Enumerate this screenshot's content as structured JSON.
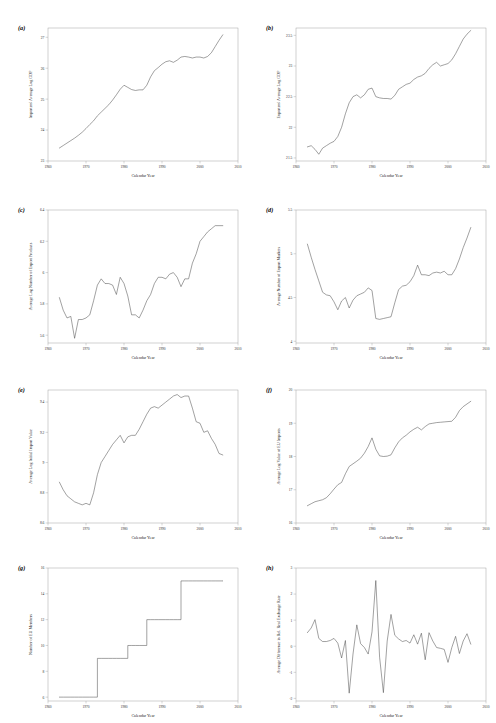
{
  "figure": {
    "panel_count": 8,
    "shared_xlabel": "Calendar Year",
    "shared_xticks": [
      "1960",
      "1970",
      "1980",
      "1990",
      "2000",
      "2010"
    ],
    "xlim": [
      1960,
      2010
    ]
  },
  "chart_data": [
    {
      "type": "line",
      "tag": "(a)",
      "title": "",
      "xlabel": "Calendar Year",
      "ylabel": "Importers' Average Log GDP",
      "xlim": [
        1960,
        2010
      ],
      "ylim": [
        23,
        27.3
      ],
      "xticks": [
        1960,
        1970,
        1980,
        1990,
        2000,
        2010
      ],
      "xticklabels": [
        "1960",
        "1970",
        "1980",
        "1990",
        "2000",
        "2010"
      ],
      "yticks": [
        23,
        24,
        25,
        26,
        27
      ],
      "yticklabels": [
        "23",
        "24",
        "25",
        "26",
        "27"
      ],
      "grid": false,
      "legend": "none",
      "x": [
        1963,
        1964,
        1965,
        1966,
        1967,
        1968,
        1969,
        1970,
        1971,
        1972,
        1973,
        1974,
        1975,
        1976,
        1977,
        1978,
        1979,
        1980,
        1981,
        1982,
        1983,
        1984,
        1985,
        1986,
        1987,
        1988,
        1989,
        1990,
        1991,
        1992,
        1993,
        1994,
        1995,
        1996,
        1997,
        1998,
        1999,
        2000,
        2001,
        2002,
        2003,
        2004,
        2005,
        2006
      ],
      "y": [
        23.42,
        23.5,
        23.58,
        23.66,
        23.74,
        23.83,
        23.93,
        24.05,
        24.18,
        24.3,
        24.46,
        24.58,
        24.7,
        24.82,
        24.97,
        25.14,
        25.32,
        25.45,
        25.38,
        25.31,
        25.28,
        25.3,
        25.3,
        25.45,
        25.72,
        25.92,
        26.02,
        26.13,
        26.21,
        26.24,
        26.19,
        26.26,
        26.36,
        26.38,
        26.36,
        26.33,
        26.36,
        26.36,
        26.33,
        26.38,
        26.5,
        26.7,
        26.9,
        27.08
      ],
      "series_note": "Importers' average log GDP, steadily rising with plateaus around 1981-1985 and 1996-2002"
    },
    {
      "type": "line",
      "tag": "(b)",
      "title": "",
      "xlabel": "Calendar Year",
      "ylabel": "Exporters' Average Log GDP",
      "xlim": [
        1960,
        2010
      ],
      "ylim": [
        21.45,
        23.62
      ],
      "xticks": [
        1960,
        1970,
        1980,
        1990,
        2000,
        2010
      ],
      "xticklabels": [
        "1960",
        "1970",
        "1980",
        "1990",
        "2000",
        "2010"
      ],
      "yticks": [
        21.5,
        22,
        22.5,
        23,
        23.5
      ],
      "yticklabels": [
        "21.5",
        "22",
        "22.5",
        "23",
        "23.5"
      ],
      "grid": false,
      "legend": "none",
      "x": [
        1963,
        1964,
        1965,
        1966,
        1967,
        1968,
        1969,
        1970,
        1971,
        1972,
        1973,
        1974,
        1975,
        1976,
        1977,
        1978,
        1979,
        1980,
        1981,
        1982,
        1983,
        1984,
        1985,
        1986,
        1987,
        1988,
        1989,
        1990,
        1991,
        1992,
        1993,
        1994,
        1995,
        1996,
        1997,
        1998,
        1999,
        2000,
        2001,
        2002,
        2003,
        2004,
        2005,
        2006
      ],
      "y": [
        21.68,
        21.7,
        21.64,
        21.56,
        21.66,
        21.7,
        21.74,
        21.77,
        21.85,
        22.0,
        22.22,
        22.4,
        22.5,
        22.53,
        22.48,
        22.53,
        22.62,
        22.64,
        22.5,
        22.48,
        22.47,
        22.47,
        22.46,
        22.52,
        22.62,
        22.66,
        22.7,
        22.72,
        22.78,
        22.82,
        22.84,
        22.88,
        22.96,
        23.02,
        23.06,
        23.0,
        23.02,
        23.04,
        23.1,
        23.2,
        23.32,
        23.44,
        23.52,
        23.58
      ],
      "series_note": "Exporters' average log GDP, dip near 1967, sharp rise through 1970s, plateau 1981-1986, steady climb to 2006"
    },
    {
      "type": "line",
      "tag": "(c)",
      "title": "",
      "xlabel": "Calendar Year",
      "ylabel": "Average Log Number of Export Products",
      "xlim": [
        1960,
        2010
      ],
      "ylim": [
        5.55,
        6.4
      ],
      "xticks": [
        1960,
        1970,
        1980,
        1990,
        2000,
        2010
      ],
      "xticklabels": [
        "1960",
        "1970",
        "1980",
        "1990",
        "2000",
        "2010"
      ],
      "yticks": [
        5.6,
        5.8,
        6.0,
        6.2,
        6.4
      ],
      "yticklabels": [
        "5.6",
        "5.8",
        "6",
        "6.2",
        "6.4"
      ],
      "grid": false,
      "legend": "none",
      "x": [
        1963,
        1964,
        1965,
        1966,
        1967,
        1968,
        1969,
        1970,
        1971,
        1972,
        1973,
        1974,
        1975,
        1976,
        1977,
        1978,
        1979,
        1980,
        1981,
        1982,
        1983,
        1984,
        1985,
        1986,
        1987,
        1988,
        1989,
        1990,
        1991,
        1992,
        1993,
        1994,
        1995,
        1996,
        1997,
        1998,
        1999,
        2000,
        2001,
        2002,
        2003,
        2004,
        2005,
        2006
      ],
      "y": [
        5.84,
        5.76,
        5.71,
        5.72,
        5.58,
        5.7,
        5.7,
        5.71,
        5.73,
        5.82,
        5.92,
        5.96,
        5.93,
        5.93,
        5.92,
        5.86,
        5.97,
        5.93,
        5.85,
        5.73,
        5.73,
        5.71,
        5.76,
        5.82,
        5.86,
        5.93,
        5.97,
        5.97,
        5.96,
        5.99,
        6.0,
        5.97,
        5.91,
        5.96,
        5.96,
        6.06,
        6.12,
        6.2,
        6.23,
        6.26,
        6.28,
        6.3,
        6.3,
        6.3
      ],
      "series_note": "Average log number of export products, volatile mid-century, strong upward trend after 1997"
    },
    {
      "type": "line",
      "tag": "(d)",
      "title": "",
      "xlabel": "Calendar Year",
      "ylabel": "Average Number of Export Markets",
      "xlim": [
        1960,
        2010
      ],
      "ylim": [
        3.98,
        5.5
      ],
      "xticks": [
        1960,
        1970,
        1980,
        1990,
        2000,
        2010
      ],
      "xticklabels": [
        "1960",
        "1970",
        "1980",
        "1990",
        "2000",
        "2010"
      ],
      "yticks": [
        4,
        4.5,
        5,
        5.5
      ],
      "yticklabels": [
        "4",
        "4.5",
        "5",
        "5.5"
      ],
      "grid": false,
      "legend": "none",
      "x": [
        1963,
        1964,
        1965,
        1966,
        1967,
        1968,
        1969,
        1970,
        1971,
        1972,
        1973,
        1974,
        1975,
        1976,
        1977,
        1978,
        1979,
        1980,
        1981,
        1982,
        1983,
        1984,
        1985,
        1986,
        1987,
        1988,
        1989,
        1990,
        1991,
        1992,
        1993,
        1994,
        1995,
        1996,
        1997,
        1998,
        1999,
        2000,
        2001,
        2002,
        2003,
        2004,
        2005,
        2006
      ],
      "y": [
        5.11,
        4.96,
        4.82,
        4.69,
        4.56,
        4.53,
        4.52,
        4.45,
        4.36,
        4.46,
        4.5,
        4.38,
        4.47,
        4.52,
        4.54,
        4.56,
        4.61,
        4.58,
        4.26,
        4.25,
        4.26,
        4.27,
        4.28,
        4.44,
        4.59,
        4.63,
        4.64,
        4.68,
        4.75,
        4.87,
        4.76,
        4.76,
        4.75,
        4.78,
        4.79,
        4.78,
        4.8,
        4.76,
        4.76,
        4.83,
        4.94,
        5.07,
        5.18,
        5.3
      ],
      "series_note": "Average number of export markets, declines through 1960s-70s, trough 1981-1985, recovery to 5.3 by 2006"
    },
    {
      "type": "line",
      "tag": "(e)",
      "title": "",
      "xlabel": "Calendar Year",
      "ylabel": "Average Log Initial Import Value",
      "xlim": [
        1960,
        2010
      ],
      "ylim": [
        8.6,
        9.48
      ],
      "xticks": [
        1960,
        1970,
        1980,
        1990,
        2000,
        2010
      ],
      "xticklabels": [
        "1960",
        "1970",
        "1980",
        "1990",
        "2000",
        "2010"
      ],
      "yticks": [
        8.6,
        8.8,
        9.0,
        9.2,
        9.4
      ],
      "yticklabels": [
        "8.6",
        "8.8",
        "9",
        "9.2",
        "9.4"
      ],
      "grid": false,
      "legend": "none",
      "x": [
        1963,
        1964,
        1965,
        1966,
        1967,
        1968,
        1969,
        1970,
        1971,
        1972,
        1973,
        1974,
        1975,
        1976,
        1977,
        1978,
        1979,
        1980,
        1981,
        1982,
        1983,
        1984,
        1985,
        1986,
        1987,
        1988,
        1989,
        1990,
        1991,
        1992,
        1993,
        1994,
        1995,
        1996,
        1997,
        1998,
        1999,
        2000,
        2001,
        2002,
        2003,
        2004,
        2005,
        2006
      ],
      "y": [
        8.87,
        8.82,
        8.78,
        8.76,
        8.74,
        8.73,
        8.72,
        8.73,
        8.72,
        8.8,
        8.92,
        9.0,
        9.04,
        9.08,
        9.12,
        9.15,
        9.18,
        9.13,
        9.17,
        9.18,
        9.18,
        9.22,
        9.27,
        9.32,
        9.36,
        9.37,
        9.36,
        9.38,
        9.4,
        9.42,
        9.44,
        9.45,
        9.43,
        9.44,
        9.44,
        9.36,
        9.27,
        9.26,
        9.2,
        9.21,
        9.16,
        9.12,
        9.06,
        9.05
      ],
      "series_note": "Average log initial import value, declining early, rising sharply 1971-1979, peak near 1996, decline after 1998"
    },
    {
      "type": "line",
      "tag": "(f)",
      "title": "",
      "xlabel": "Calendar Year",
      "ylabel": "Average Log Value of EU Imports",
      "xlim": [
        1960,
        2010
      ],
      "ylim": [
        16,
        20
      ],
      "xticks": [
        1960,
        1970,
        1980,
        1990,
        2000,
        2010
      ],
      "xticklabels": [
        "1960",
        "1970",
        "1980",
        "1990",
        "2000",
        "2010"
      ],
      "yticks": [
        16,
        17,
        18,
        19,
        20
      ],
      "yticklabels": [
        "16",
        "17",
        "18",
        "19",
        "20"
      ],
      "grid": false,
      "legend": "none",
      "x": [
        1963,
        1964,
        1965,
        1966,
        1967,
        1968,
        1969,
        1970,
        1971,
        1972,
        1973,
        1974,
        1975,
        1976,
        1977,
        1978,
        1979,
        1980,
        1981,
        1982,
        1983,
        1984,
        1985,
        1986,
        1987,
        1988,
        1989,
        1990,
        1991,
        1992,
        1993,
        1994,
        1995,
        1996,
        1997,
        1998,
        1999,
        2000,
        2001,
        2002,
        2003,
        2004,
        2005,
        2006
      ],
      "y": [
        16.52,
        16.58,
        16.64,
        16.67,
        16.7,
        16.76,
        16.88,
        17.02,
        17.15,
        17.22,
        17.48,
        17.7,
        17.78,
        17.86,
        17.95,
        18.1,
        18.3,
        18.56,
        18.22,
        18.02,
        18.0,
        18.01,
        18.05,
        18.26,
        18.44,
        18.56,
        18.64,
        18.74,
        18.82,
        18.88,
        18.8,
        18.9,
        18.98,
        19.0,
        19.02,
        19.03,
        19.04,
        19.05,
        19.06,
        19.18,
        19.38,
        19.5,
        19.58,
        19.66
      ],
      "series_note": "Average log value of EU imports, monotone rising with dip around 1981-1983"
    },
    {
      "type": "line",
      "tag": "(g)",
      "title": "",
      "xlabel": "Calendar Year",
      "ylabel": "Number of EU Members",
      "xlim": [
        1960,
        2010
      ],
      "ylim": [
        5.7,
        16
      ],
      "xticks": [
        1960,
        1970,
        1980,
        1990,
        2000,
        2010
      ],
      "xticklabels": [
        "1960",
        "1970",
        "1980",
        "1990",
        "2000",
        "2010"
      ],
      "yticks": [
        6,
        8,
        10,
        12,
        14,
        16
      ],
      "yticklabels": [
        "6",
        "8",
        "10",
        "12",
        "14",
        "16"
      ],
      "grid": false,
      "legend": "none",
      "x": [
        1963,
        1964,
        1965,
        1966,
        1967,
        1968,
        1969,
        1970,
        1971,
        1972,
        1973,
        1974,
        1975,
        1976,
        1977,
        1978,
        1979,
        1980,
        1981,
        1982,
        1983,
        1984,
        1985,
        1986,
        1987,
        1988,
        1989,
        1990,
        1991,
        1992,
        1993,
        1994,
        1995,
        1996,
        1997,
        1998,
        1999,
        2000,
        2001,
        2002,
        2003,
        2004,
        2005,
        2006
      ],
      "y": [
        6,
        6,
        6,
        6,
        6,
        6,
        6,
        6,
        6,
        6,
        9,
        9,
        9,
        9,
        9,
        9,
        9,
        9,
        10,
        10,
        10,
        10,
        10,
        12,
        12,
        12,
        12,
        12,
        12,
        12,
        12,
        12,
        15,
        15,
        15,
        15,
        15,
        15,
        15,
        15,
        15,
        15,
        15,
        15
      ],
      "series_note": "Step function: EU membership 6 until 1972, 9 from 1973, 10 from 1981, 12 from 1986, 15 from 1995"
    },
    {
      "type": "line",
      "tag": "(h)",
      "title": "",
      "xlabel": "Calendar Year",
      "ylabel": "Average Difference in Rel. Real Exchange Rate",
      "xlim": [
        1960,
        2010
      ],
      "ylim": [
        -2.1,
        3
      ],
      "xticks": [
        1960,
        1970,
        1980,
        1990,
        2000,
        2010
      ],
      "xticklabels": [
        "1960",
        "1970",
        "1980",
        "1990",
        "2000",
        "2010"
      ],
      "yticks": [
        -2,
        -1,
        0,
        1,
        2,
        3
      ],
      "yticklabels": [
        "-2",
        "-1",
        "0",
        "1",
        "2",
        "3"
      ],
      "grid": false,
      "legend": "none",
      "x": [
        1963,
        1964,
        1965,
        1966,
        1967,
        1968,
        1969,
        1970,
        1971,
        1972,
        1973,
        1974,
        1975,
        1976,
        1977,
        1978,
        1979,
        1980,
        1981,
        1982,
        1983,
        1984,
        1985,
        1986,
        1987,
        1988,
        1989,
        1990,
        1991,
        1992,
        1993,
        1994,
        1995,
        1996,
        1997,
        1998,
        1999,
        2000,
        2001,
        2002,
        2003,
        2004,
        2005,
        2006
      ],
      "y": [
        0.52,
        0.7,
        1.02,
        0.3,
        0.18,
        0.18,
        0.22,
        0.3,
        0.12,
        -0.45,
        0.22,
        -1.8,
        -0.3,
        0.82,
        0.1,
        -0.05,
        -0.3,
        0.55,
        2.52,
        -0.42,
        -1.78,
        0.2,
        1.22,
        0.42,
        0.28,
        0.18,
        0.22,
        0.12,
        0.44,
        0.08,
        0.5,
        -0.52,
        0.52,
        0.2,
        -0.05,
        -0.08,
        -0.12,
        -0.62,
        -0.05,
        0.38,
        -0.28,
        0.2,
        0.48,
        0.08
      ],
      "series_note": "Average difference in relative real exchange rate, highly volatile, spikes at 1981 (2.5) and troughs at 1974 and 1983 (-1.8)"
    }
  ]
}
